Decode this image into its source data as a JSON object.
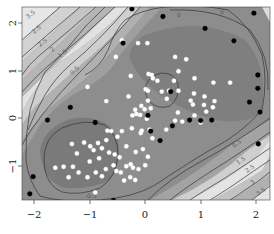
{
  "chart_data": {
    "type": "contour",
    "title": "",
    "xlabel": "",
    "ylabel": "",
    "xlim": [
      -2.22,
      2.25
    ],
    "ylim": [
      -1.73,
      2.33
    ],
    "grid": false,
    "legend": null,
    "x_ticks": [
      -2,
      -1,
      0,
      1,
      2
    ],
    "x_tick_labels": [
      "−2",
      "−1",
      "0",
      "1",
      "2"
    ],
    "y_ticks": [
      -1,
      0,
      1,
      2
    ],
    "y_tick_labels": [
      "−1",
      "0",
      "1",
      "2"
    ],
    "contour_levels": [
      -0.5,
      0,
      0.5,
      1,
      1.5,
      2,
      2.5,
      3,
      3.5,
      4
    ],
    "contour_label_samples": [
      "−0.5",
      "0",
      "0.5",
      "1",
      "1.5",
      "2",
      "2.5",
      "3",
      "3.5"
    ],
    "fill_colormap": "grayscale (dark = low/inside, light = high/outside)",
    "series": [
      {
        "name": "training points",
        "marker": "white circle",
        "color": "#ffffff",
        "points": [
          [
            -0.42,
            1.63
          ],
          [
            -0.53,
            1.28
          ],
          [
            -0.13,
            1.57
          ],
          [
            0.04,
            1.57
          ],
          [
            -0.26,
            0.88
          ],
          [
            -1.04,
            0.65
          ],
          [
            -0.7,
            0.35
          ],
          [
            0.06,
            0.92
          ],
          [
            0.12,
            0.9
          ],
          [
            0.22,
            0.78
          ],
          [
            0.14,
            0.83
          ],
          [
            0.01,
            0.6
          ],
          [
            0.05,
            0.57
          ],
          [
            0.3,
            0.55
          ],
          [
            0.39,
            0.4
          ],
          [
            0.05,
            0.36
          ],
          [
            -0.07,
            0.25
          ],
          [
            -0.01,
            0.18
          ],
          [
            0.1,
            0.2
          ],
          [
            -0.18,
            0.17
          ],
          [
            -0.23,
            0.05
          ],
          [
            -0.09,
            0.06
          ],
          [
            0.54,
            1.28
          ],
          [
            0.74,
            1.23
          ],
          [
            0.6,
            0.98
          ],
          [
            0.52,
            0.78
          ],
          [
            0.89,
            0.83
          ],
          [
            1.23,
            0.74
          ],
          [
            0.43,
            0.57
          ],
          [
            0.6,
            0.57
          ],
          [
            0.88,
            0.51
          ],
          [
            1.07,
            0.45
          ],
          [
            1.25,
            0.35
          ],
          [
            1.53,
            0.74
          ],
          [
            0.82,
            0.36
          ],
          [
            0.86,
            0.28
          ],
          [
            1.06,
            0.27
          ],
          [
            1.22,
            0.22
          ],
          [
            0.59,
            0.11
          ],
          [
            0.54,
            -0.06
          ],
          [
            0.67,
            -0.08
          ],
          [
            0.89,
            0.05
          ],
          [
            1.1,
            0.13
          ],
          [
            1.0,
            -0.1
          ],
          [
            0.38,
            -0.25
          ],
          [
            0.08,
            -0.25
          ],
          [
            -0.16,
            0.08
          ],
          [
            0.03,
            -0.02
          ],
          [
            -0.08,
            -0.32
          ],
          [
            -1.1,
            -0.52
          ],
          [
            -0.99,
            -0.6
          ],
          [
            -0.85,
            -0.53
          ],
          [
            -0.7,
            -0.47
          ],
          [
            -1.32,
            -0.55
          ],
          [
            -1.23,
            -0.75
          ],
          [
            -0.93,
            -0.68
          ],
          [
            -0.78,
            -0.64
          ],
          [
            -0.65,
            -0.73
          ],
          [
            -0.55,
            -0.77
          ],
          [
            -0.46,
            -0.83
          ],
          [
            -0.83,
            -0.85
          ],
          [
            -1.0,
            -0.92
          ],
          [
            -1.3,
            -1.03
          ],
          [
            -1.62,
            -1.05
          ],
          [
            -1.47,
            -1.03
          ],
          [
            -1.2,
            -1.15
          ],
          [
            -0.89,
            -1.15
          ],
          [
            -0.71,
            -1.08
          ],
          [
            -0.57,
            -1.0
          ],
          [
            -0.52,
            -1.12
          ],
          [
            -0.44,
            -1.15
          ],
          [
            -0.34,
            -1.02
          ],
          [
            -0.22,
            -1.05
          ],
          [
            -0.12,
            -1.08
          ],
          [
            -0.27,
            -1.25
          ],
          [
            -0.38,
            -1.32
          ],
          [
            -1.38,
            -1.25
          ],
          [
            -1.04,
            -1.25
          ],
          [
            -0.78,
            -1.23
          ],
          [
            -0.9,
            -1.57
          ],
          [
            -0.34,
            -0.6
          ],
          [
            -0.17,
            -0.72
          ],
          [
            -0.04,
            -0.66
          ],
          [
            -0.5,
            -0.4
          ],
          [
            -0.68,
            -0.27
          ],
          [
            -0.42,
            -0.28
          ],
          [
            -0.24,
            -0.22
          ],
          [
            -0.06,
            -0.27
          ],
          [
            0.13,
            -0.43
          ],
          [
            0.05,
            -0.82
          ],
          [
            0.0,
            -1.0
          ],
          [
            -0.18,
            -1.31
          ],
          [
            -0.26,
            -0.98
          ],
          [
            -0.61,
            -0.28
          ],
          [
            -0.3,
            0.45
          ]
        ]
      },
      {
        "name": "support vectors",
        "marker": "black circle",
        "color": "#000000",
        "points": [
          [
            -0.24,
            2.29
          ],
          [
            -1.35,
            0.22
          ],
          [
            -1.76,
            -0.05
          ],
          [
            0.32,
            2.13
          ],
          [
            1.08,
            1.88
          ],
          [
            1.6,
            1.62
          ],
          [
            1.96,
            2.2
          ],
          [
            2.03,
            0.9
          ],
          [
            2.07,
            0.12
          ],
          [
            -0.4,
            1.57
          ],
          [
            0.46,
            0.55
          ],
          [
            0.05,
            0.05
          ],
          [
            0.49,
            -0.17
          ],
          [
            -0.9,
            -0.1
          ],
          [
            -2.02,
            -1.24
          ],
          [
            -2.08,
            -1.6
          ],
          [
            -0.57,
            -1.74
          ],
          [
            1.2,
            -0.05
          ],
          [
            2.04,
            -0.55
          ],
          [
            2.03,
            0.62
          ],
          [
            0.8,
            -0.05
          ],
          [
            0.27,
            -0.48
          ],
          [
            1.88,
            0.33
          ],
          [
            0.1,
            -0.28
          ],
          [
            1.0,
            -0.06
          ]
        ]
      }
    ]
  },
  "axes": {
    "x_tick_labels": [
      "−2",
      "−1",
      "0",
      "1",
      "2"
    ],
    "y_tick_labels": [
      "−1",
      "0",
      "1",
      "2"
    ]
  }
}
